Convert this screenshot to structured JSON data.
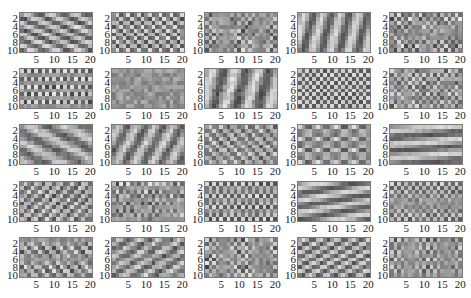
{
  "chart_data": {
    "type": "heatmap",
    "title": "",
    "layout": {
      "rows": 5,
      "cols": 5
    },
    "grid_size": {
      "rows": 10,
      "cols": 20
    },
    "colormap": "gray",
    "xticks": [
      "5",
      "10",
      "15",
      "20"
    ],
    "yticks": [
      "2",
      "4",
      "6",
      "8",
      "10"
    ],
    "xlim": [
      0.5,
      20.5
    ],
    "ylim": [
      0.5,
      10.5
    ],
    "panels": [
      {
        "pattern": "diag",
        "fx": 0.15,
        "fy": -0.35,
        "amp": 0.45,
        "noise": 0.12
      },
      {
        "pattern": "diag",
        "fx": 0.33,
        "fy": -0.45,
        "amp": 0.5,
        "noise": 0.1
      },
      {
        "pattern": "checker-sparse",
        "fx": 0.45,
        "fy": 0.5,
        "amp": 0.35,
        "noise": 0.2
      },
      {
        "pattern": "diag",
        "fx": 0.2,
        "fy": 0.06,
        "amp": 0.45,
        "noise": 0.08
      },
      {
        "pattern": "checker-sparse",
        "fx": 0.5,
        "fy": 0.45,
        "amp": 0.4,
        "noise": 0.25
      },
      {
        "pattern": "grid",
        "fx": 0.5,
        "fy": 0.25,
        "amp": 0.45,
        "noise": 0.15
      },
      {
        "pattern": "hblocks",
        "fx": 0.12,
        "fy": 0.5,
        "amp": 0.35,
        "noise": 0.2
      },
      {
        "pattern": "vbands",
        "fx": 0.16,
        "fy": 0.05,
        "amp": 0.45,
        "noise": 0.15
      },
      {
        "pattern": "checker",
        "fx": 0.5,
        "fy": 0.5,
        "amp": 0.45,
        "noise": 0.1
      },
      {
        "pattern": "checker-sparse",
        "fx": 0.5,
        "fy": 0.5,
        "amp": 0.3,
        "noise": 0.2
      },
      {
        "pattern": "diag",
        "fx": 0.1,
        "fy": -0.2,
        "amp": 0.35,
        "noise": 0.15
      },
      {
        "pattern": "vbands",
        "fx": 0.2,
        "fy": 0.12,
        "amp": 0.4,
        "noise": 0.12
      },
      {
        "pattern": "diag",
        "fx": 0.3,
        "fy": -0.35,
        "amp": 0.35,
        "noise": 0.15
      },
      {
        "pattern": "grid",
        "fx": 0.2,
        "fy": 0.33,
        "amp": 0.45,
        "noise": 0.1
      },
      {
        "pattern": "hbands",
        "fx": 0.02,
        "fy": 0.28,
        "amp": 0.45,
        "noise": 0.08
      },
      {
        "pattern": "diag",
        "fx": 0.3,
        "fy": 0.35,
        "amp": 0.4,
        "noise": 0.15
      },
      {
        "pattern": "checker-sparse",
        "fx": 0.5,
        "fy": 0.3,
        "amp": 0.4,
        "noise": 0.2
      },
      {
        "pattern": "grid",
        "fx": 0.5,
        "fy": 0.33,
        "amp": 0.45,
        "noise": 0.12
      },
      {
        "pattern": "hbands",
        "fx": 0.05,
        "fy": 0.3,
        "amp": 0.45,
        "noise": 0.08
      },
      {
        "pattern": "checker",
        "fx": 0.5,
        "fy": 0.45,
        "amp": 0.4,
        "noise": 0.15
      },
      {
        "pattern": "hblocks",
        "fx": 0.3,
        "fy": 0.4,
        "amp": 0.45,
        "noise": 0.18
      },
      {
        "pattern": "diag",
        "fx": 0.18,
        "fy": 0.3,
        "amp": 0.35,
        "noise": 0.2
      },
      {
        "pattern": "checker-sparse",
        "fx": 0.45,
        "fy": -0.5,
        "amp": 0.4,
        "noise": 0.2
      },
      {
        "pattern": "diag",
        "fx": 0.22,
        "fy": 0.4,
        "amp": 0.45,
        "noise": 0.08
      },
      {
        "pattern": "grid",
        "fx": 0.45,
        "fy": 0.3,
        "amp": 0.4,
        "noise": 0.15
      }
    ]
  }
}
